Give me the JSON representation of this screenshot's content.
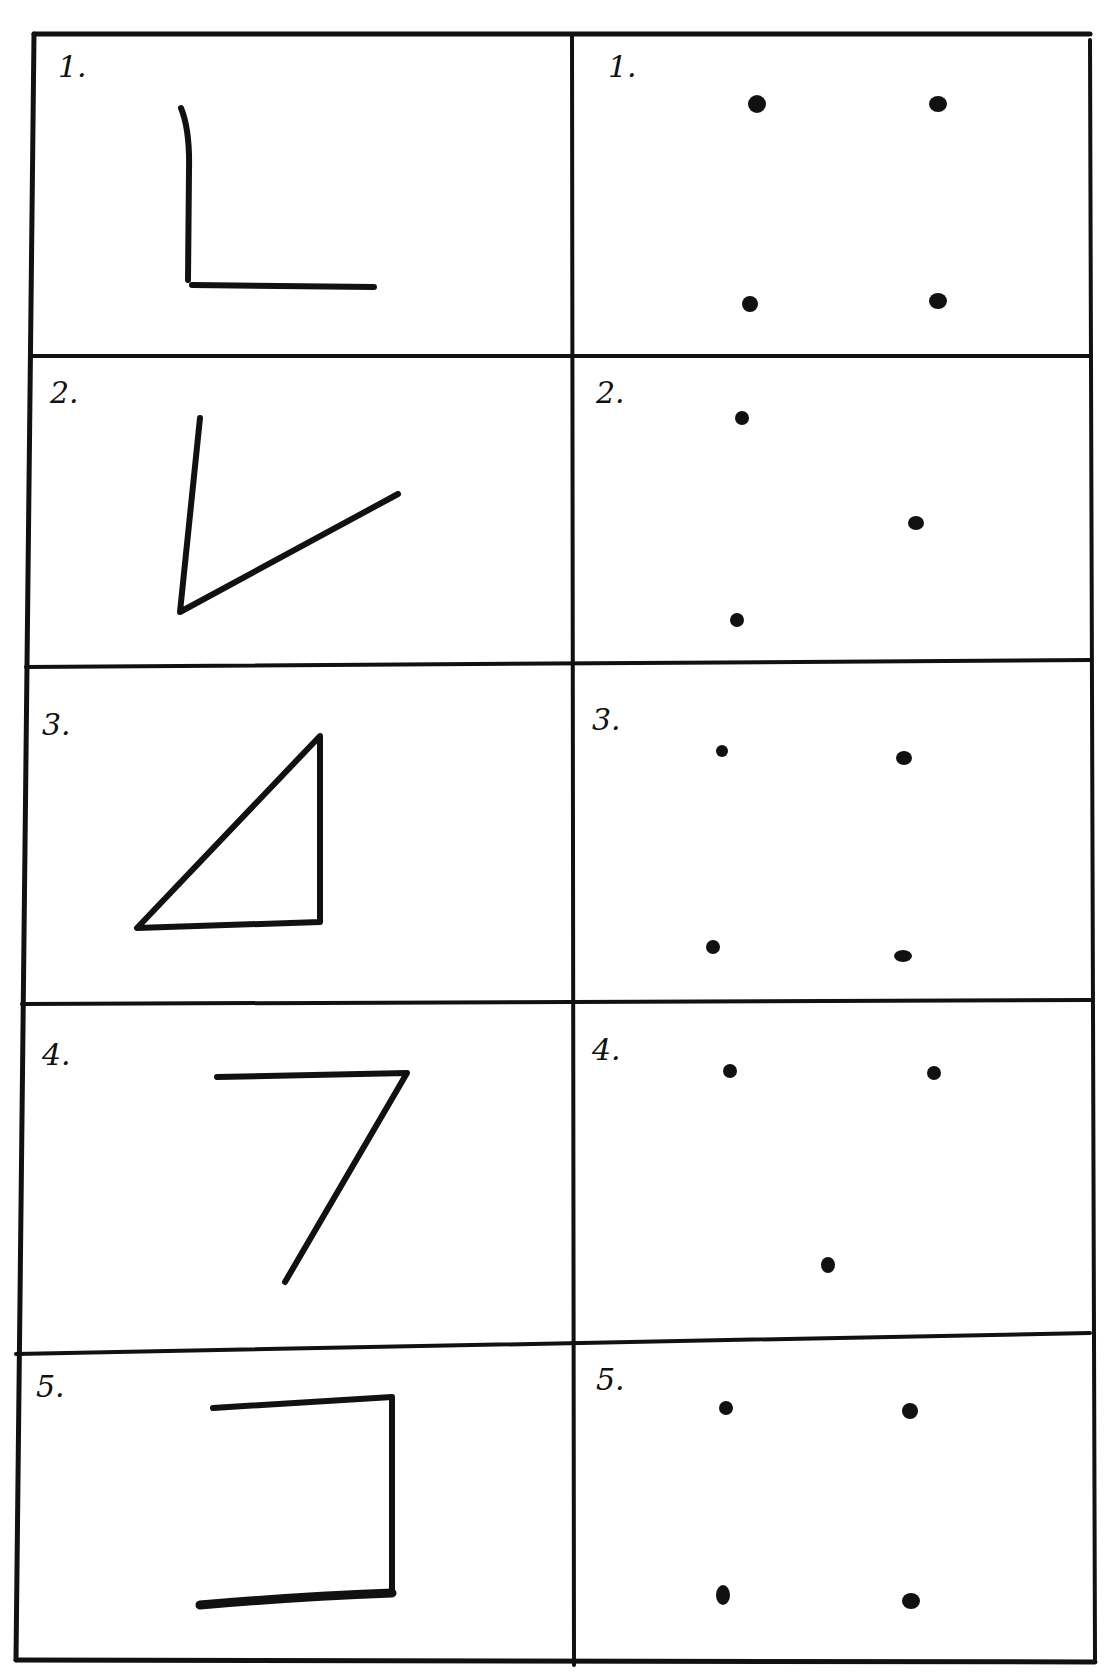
{
  "worksheet": {
    "rows": [
      {
        "left_label": "1.",
        "right_label": "1.",
        "shape": "L-shape (two segments, right angle)",
        "dots": 4
      },
      {
        "left_label": "2.",
        "right_label": "2.",
        "shape": "V-shape (two segments, acute angle)",
        "dots": 3
      },
      {
        "left_label": "3.",
        "right_label": "3.",
        "shape": "right triangle",
        "dots": 4
      },
      {
        "left_label": "4.",
        "right_label": "4.",
        "shape": "7-shape (two segments)",
        "dots": 3
      },
      {
        "left_label": "5.",
        "right_label": "5.",
        "shape": "bracket (three segments)",
        "dots": 4
      }
    ],
    "ink_color": "#111111",
    "paper_color": "#ffffff"
  }
}
